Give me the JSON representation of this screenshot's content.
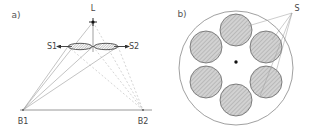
{
  "figure": {
    "width": 313,
    "height": 132,
    "background": "#ffffff"
  },
  "panel_a": {
    "label": "a)",
    "label_pos": {
      "x": 16,
      "y": 17
    },
    "apex": {
      "name": "L",
      "label": "L",
      "label_pos": {
        "x": 93,
        "y": 11
      },
      "point": {
        "x": 93,
        "y": 22
      }
    },
    "baseline": {
      "y": 110,
      "x1": 20,
      "x2": 152,
      "color": "#8d8d8d"
    },
    "base_points": [
      {
        "name": "B1",
        "label": "B1",
        "x": 23,
        "y": 110,
        "label_x": 23,
        "label_y": 123
      },
      {
        "name": "B2",
        "label": "B2",
        "x": 143,
        "y": 110,
        "label_x": 143,
        "label_y": 123
      }
    ],
    "sources": [
      {
        "name": "S1",
        "label": "S1",
        "label_pos": {
          "x": 52,
          "y": 48
        },
        "ellipse": {
          "cx": 80,
          "cy": 46.5,
          "rx": 12,
          "ry": 3.2
        },
        "arrow_from": {
          "x": 60,
          "y": 46.5
        },
        "arrow_to": {
          "x": 93,
          "y": 46.5
        }
      },
      {
        "name": "S2",
        "label": "S2",
        "label_pos": {
          "x": 133,
          "y": 48
        },
        "ellipse": {
          "cx": 106,
          "cy": 46.5,
          "rx": 12,
          "ry": 3.2
        },
        "arrow_from": {
          "x": 126,
          "y": 46.5
        },
        "arrow_to": {
          "x": 93,
          "y": 46.5
        }
      }
    ],
    "ray_style_solid": "#9a9a9a",
    "ray_style_dashed": "#b8b8b8"
  },
  "panel_b": {
    "label": "b)",
    "label_pos": {
      "x": 182,
      "y": 16
    },
    "outer_circle": {
      "cx": 236,
      "cy": 68,
      "r": 57,
      "stroke": "#888888"
    },
    "center_dot": {
      "cx": 236,
      "cy": 62,
      "r": 1.6,
      "fill": "#111111"
    },
    "ring": {
      "cx": 236,
      "cy": 65,
      "radius": 35
    },
    "spot_radius": 16,
    "spot_fill": "#d2d2d2",
    "spot_stroke": "#666666",
    "spots": [
      {
        "cx": 236,
        "cy": 30
      },
      {
        "cx": 266,
        "cy": 47
      },
      {
        "cx": 266,
        "cy": 82
      },
      {
        "cx": 236,
        "cy": 100
      },
      {
        "cx": 206,
        "cy": 82
      },
      {
        "cx": 206,
        "cy": 47
      }
    ],
    "callout": {
      "label": "S",
      "label_pos": {
        "x": 295,
        "y": 10
      },
      "anchor": {
        "x": 292,
        "y": 13
      },
      "targets": [
        {
          "x": 248,
          "y": 26
        },
        {
          "x": 272,
          "y": 40
        },
        {
          "x": 274,
          "y": 72
        },
        {
          "x": 258,
          "y": 95
        }
      ]
    }
  }
}
